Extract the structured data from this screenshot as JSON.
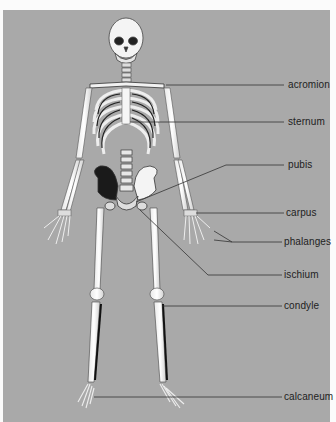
{
  "diagram": {
    "background_color": "#a9a9a9",
    "labels": [
      {
        "id": "acromion",
        "text": "acromion",
        "x": 288,
        "y": 79
      },
      {
        "id": "sternum",
        "text": "sternum",
        "x": 288,
        "y": 116
      },
      {
        "id": "pubis",
        "text": "pubis",
        "x": 288,
        "y": 159
      },
      {
        "id": "carpus",
        "text": "carpus",
        "x": 288,
        "y": 207
      },
      {
        "id": "phalanges",
        "text": "phalanges",
        "x": 285,
        "y": 236
      },
      {
        "id": "ischium",
        "text": "ischium",
        "x": 285,
        "y": 269
      },
      {
        "id": "condyle",
        "text": "condyle",
        "x": 285,
        "y": 300
      },
      {
        "id": "calcaneum",
        "text": "calcaneum",
        "x": 285,
        "y": 391
      }
    ]
  }
}
